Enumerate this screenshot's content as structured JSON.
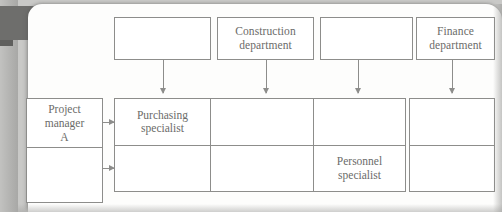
{
  "diagram": {
    "type": "matrix-organization-chart",
    "top_row": [
      {
        "id": "dept-1",
        "label": "",
        "x": 114,
        "y": 17,
        "w": 97,
        "h": 43
      },
      {
        "id": "dept-2",
        "label": "Construction\ndepartment",
        "x": 217,
        "y": 17,
        "w": 97,
        "h": 43
      },
      {
        "id": "dept-3",
        "label": "",
        "x": 310,
        "y": 17,
        "w": 97,
        "h": 43
      },
      {
        "id": "dept-4",
        "label": "Finance\ndepartment",
        "x": 409,
        "y": 17,
        "w": 86,
        "h": 43
      }
    ],
    "side_box": {
      "id": "project-manager-a",
      "top_label": "Project\nmanager\nA",
      "bottom_label": "",
      "x": 26,
      "y": 98,
      "w": 77,
      "h": 105
    },
    "grid": {
      "rows": 2,
      "cols": 4,
      "cells": [
        {
          "id": "cell-r1c1",
          "label": "Purchasing\nspecialist"
        },
        {
          "id": "cell-r1c2",
          "label": ""
        },
        {
          "id": "cell-r1c3",
          "label": ""
        },
        {
          "id": "cell-r1c4",
          "label": ""
        },
        {
          "id": "cell-r2c1",
          "label": ""
        },
        {
          "id": "cell-r2c2",
          "label": ""
        },
        {
          "id": "cell-r2c3",
          "label": "Personnel\nspecialist"
        },
        {
          "id": "cell-r2c4",
          "label": ""
        }
      ]
    },
    "arrows": {
      "vertical": [
        {
          "id": "arrow-down-1",
          "x": 163,
          "y": 60,
          "len": 34
        },
        {
          "id": "arrow-down-2",
          "x": 266,
          "y": 60,
          "len": 34
        },
        {
          "id": "arrow-down-3",
          "x": 358,
          "y": 60,
          "len": 34
        },
        {
          "id": "arrow-down-4",
          "x": 452,
          "y": 60,
          "len": 34
        }
      ],
      "horizontal": [
        {
          "id": "arrow-right-1",
          "x": 103,
          "y": 122,
          "len": 11
        },
        {
          "id": "arrow-right-2",
          "x": 103,
          "y": 168,
          "len": 11
        }
      ]
    },
    "colors": {
      "line": "#8d8d8b",
      "text": "#6b6b69",
      "page": "#fdfdfc",
      "background": "#c9c9c7",
      "gutter": "#6e6e6c"
    }
  }
}
